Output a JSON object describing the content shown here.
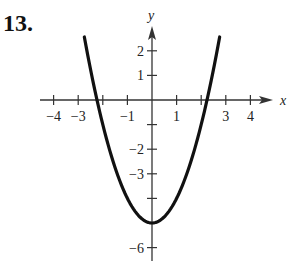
{
  "problem_number": "13.",
  "chart_data": {
    "type": "line",
    "title": "",
    "function": "y = x^2 - 5",
    "xlabel": "x",
    "ylabel": "y",
    "xlim": [
      -4.5,
      4.8
    ],
    "ylim": [
      -6.3,
      2.9
    ],
    "x_ticks": [
      -4,
      -3,
      -2,
      -1,
      1,
      2,
      3,
      4
    ],
    "x_tick_labels": [
      "-4",
      "-3",
      "",
      "-1",
      "1",
      "",
      "3",
      "4"
    ],
    "y_ticks": [
      -6,
      -5,
      -4,
      -3,
      -2,
      -1,
      1,
      2
    ],
    "y_tick_labels": [
      "-6",
      "",
      "",
      "-3",
      "-2",
      "",
      "1",
      "2"
    ],
    "grid": false,
    "vertex": [
      0,
      -5
    ],
    "x_intercepts": [
      -2.236,
      2.236
    ],
    "series": [
      {
        "name": "parabola",
        "x": [
          -2.75,
          -2.5,
          -2.0,
          -1.5,
          -1.0,
          -0.5,
          0,
          0.5,
          1.0,
          1.5,
          2.0,
          2.5,
          2.75
        ],
        "y": [
          2.56,
          1.25,
          -1.0,
          -2.75,
          -4.0,
          -4.75,
          -5.0,
          -4.75,
          -4.0,
          -2.75,
          -1.0,
          1.25,
          2.56
        ]
      }
    ]
  }
}
